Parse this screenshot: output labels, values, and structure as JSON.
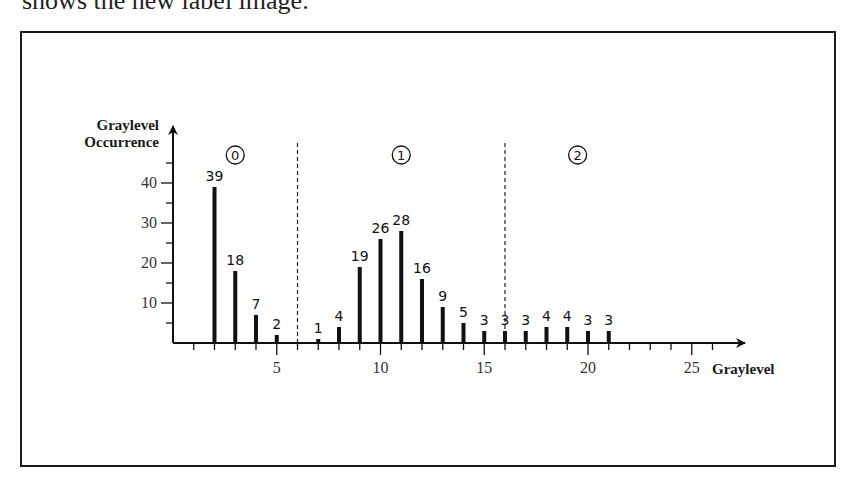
{
  "caption": "shows the new label image.",
  "chart_data": {
    "type": "bar",
    "title": "",
    "xlabel": "Graylevel",
    "ylabel_lines": [
      "Graylevel",
      "Occurrence"
    ],
    "ylabel": "Graylevel Occurrence",
    "x": [
      2,
      3,
      4,
      5,
      7,
      8,
      9,
      10,
      11,
      12,
      13,
      14,
      15,
      16,
      17,
      18,
      19,
      20,
      21
    ],
    "values": [
      39,
      18,
      7,
      2,
      1,
      4,
      19,
      26,
      28,
      16,
      9,
      5,
      3,
      3,
      3,
      4,
      4,
      3,
      3
    ],
    "xlim": [
      0,
      27
    ],
    "ylim": [
      0,
      48
    ],
    "x_ticks": [
      5,
      10,
      15,
      20,
      25
    ],
    "x_minor_step": 1,
    "y_ticks": [
      10,
      20,
      30,
      40
    ],
    "y_minor_step": 5,
    "grid": false,
    "separators": [
      6,
      16
    ],
    "regions": [
      {
        "label": "0",
        "center": 3
      },
      {
        "label": "1",
        "center": 11
      },
      {
        "label": "2",
        "center": 19.5
      }
    ]
  }
}
